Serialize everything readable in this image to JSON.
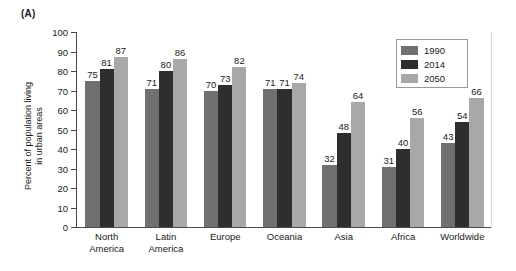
{
  "panel": {
    "label": "(A)"
  },
  "axis": {
    "ylabel_line1": "Percent of population living",
    "ylabel_line2": "in urban areas",
    "yticks": [
      "0",
      "10",
      "20",
      "30",
      "40",
      "50",
      "60",
      "70",
      "80",
      "90",
      "100"
    ]
  },
  "legend": {
    "items": [
      {
        "label": "1990",
        "color": "#707070"
      },
      {
        "label": "2014",
        "color": "#2e2e2e"
      },
      {
        "label": "2050",
        "color": "#a8a8a8"
      }
    ]
  },
  "chart_data": {
    "type": "bar",
    "title": "(A)",
    "xlabel": "",
    "ylabel": "Percent of population living in urban areas",
    "ylim": [
      0,
      100
    ],
    "ytick_step": 10,
    "grid": false,
    "legend_position": "inside-top-right",
    "categories": [
      "North America",
      "Latin America",
      "Europe",
      "Oceania",
      "Asia",
      "Africa",
      "Worldwide"
    ],
    "category_lines": [
      [
        "North",
        "America"
      ],
      [
        "Latin",
        "America"
      ],
      [
        "Europe"
      ],
      [
        "Oceania"
      ],
      [
        "Asia"
      ],
      [
        "Africa"
      ],
      [
        "Worldwide"
      ]
    ],
    "series": [
      {
        "name": "1990",
        "color": "#707070",
        "values": [
          75,
          71,
          70,
          71,
          32,
          31,
          43
        ]
      },
      {
        "name": "2014",
        "color": "#2e2e2e",
        "values": [
          81,
          80,
          73,
          71,
          48,
          40,
          54
        ]
      },
      {
        "name": "2050",
        "color": "#a8a8a8",
        "values": [
          87,
          86,
          82,
          74,
          64,
          56,
          66
        ]
      }
    ]
  }
}
